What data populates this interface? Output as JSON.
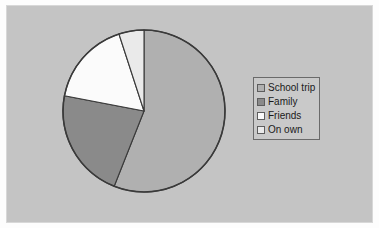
{
  "chart_data": {
    "type": "pie",
    "title": "",
    "subtitle": "",
    "xlabel": "",
    "ylabel": "",
    "grid": false,
    "legend_position": "right",
    "start_angle_deg": 0,
    "direction": "clockwise",
    "categories": [
      "School trip",
      "Family",
      "Friends",
      "On own"
    ],
    "values": [
      56,
      22,
      17,
      5
    ],
    "unit": "%",
    "angles_deg": [
      201.6,
      79.2,
      61.2,
      18.0
    ],
    "colors": [
      "#b0b0b0",
      "#8a8a8a",
      "#fbfbfb",
      "#eaeaea"
    ],
    "slices": [
      {
        "label": "School trip",
        "value": 56,
        "angle_deg": 201.6,
        "color": "#b0b0b0"
      },
      {
        "label": "Family",
        "value": 22,
        "angle_deg": 79.2,
        "color": "#8a8a8a"
      },
      {
        "label": "Friends",
        "value": 17,
        "angle_deg": 61.2,
        "color": "#fbfbfb"
      },
      {
        "label": "On own",
        "value": 5,
        "angle_deg": 18.0,
        "color": "#eaeaea"
      }
    ]
  },
  "legend": {
    "items": [
      {
        "label": "School trip",
        "color": "#b0b0b0"
      },
      {
        "label": "Family",
        "color": "#8a8a8a"
      },
      {
        "label": "Friends",
        "color": "#fbfbfb"
      },
      {
        "label": "On own",
        "color": "#eaeaea"
      }
    ]
  },
  "style": {
    "plot_background": "#c4c4c4",
    "page_background": "#fdfdfd",
    "outline_color": "#3a3a3a",
    "legend_background": "#c9c9c9",
    "legend_border": "#6a6a6a",
    "text_color": "#1a1a1a"
  }
}
